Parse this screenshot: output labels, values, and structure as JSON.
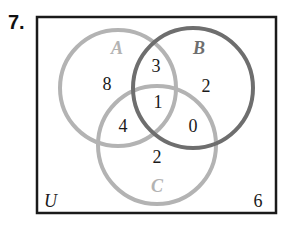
{
  "problem": {
    "number": "7."
  },
  "universe": {
    "label": "U",
    "outside_count": "6",
    "border_color": "#1a1a1a"
  },
  "sets": {
    "A": {
      "label": "A",
      "color": "#b3b3b3"
    },
    "B": {
      "label": "B",
      "color": "#6e6e6e"
    },
    "C": {
      "label": "C",
      "color": "#b3b3b3"
    }
  },
  "regions": {
    "A_only": "8",
    "B_only": "2",
    "C_only": "2",
    "A_and_B_only": "3",
    "A_and_C_only": "4",
    "B_and_C_only": "0",
    "A_and_B_and_C": "1"
  }
}
